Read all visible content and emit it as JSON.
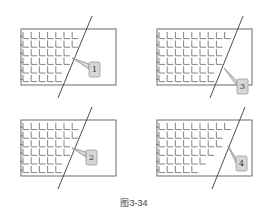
{
  "figure": {
    "caption": "图3-34",
    "colors": {
      "frame": "#6b6b6b",
      "tick": "#777777",
      "cut_line": "#3a3a3a",
      "callout_fill": "#d6d6d6"
    },
    "panels": [
      {
        "label": "1",
        "position": "top-left",
        "grid_cols": 8,
        "grid_rows": 6,
        "ticks_beyond_cut": "none"
      },
      {
        "label": "3",
        "position": "top-right",
        "grid_cols": 9,
        "grid_rows": 6,
        "ticks_beyond_cut": "none"
      },
      {
        "label": "2",
        "position": "bottom-left",
        "grid_cols": 8,
        "grid_rows": 6,
        "ticks_beyond_cut": "none"
      },
      {
        "label": "4",
        "position": "bottom-right",
        "grid_cols": 8,
        "grid_rows": 6,
        "ticks_beyond_cut": "staggered"
      }
    ]
  }
}
